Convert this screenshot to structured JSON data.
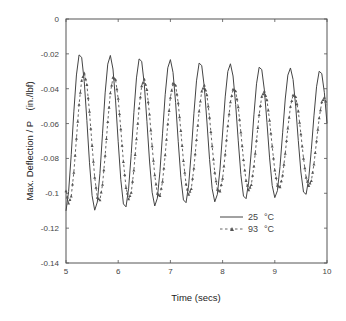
{
  "chart_data": {
    "type": "line",
    "title": "",
    "xlabel": "Time (secs)",
    "ylabel": "Max. Deflection / P    (in./lbf)",
    "xlim": [
      5,
      10
    ],
    "ylim": [
      -0.14,
      0
    ],
    "xticks": [
      5,
      6,
      7,
      8,
      9,
      10
    ],
    "xtick_labels": [
      "5",
      "6",
      "7",
      "8",
      "9",
      "10"
    ],
    "yticks": [
      0,
      -0.02,
      -0.04,
      -0.06,
      -0.08,
      -0.1,
      -0.12,
      -0.14
    ],
    "ytick_labels": [
      "0",
      "-0.02",
      "-0.04",
      "-0.06",
      "-0.08",
      "-0.1",
      "-0.12",
      "-0.14"
    ],
    "grid": false,
    "legend_position": "lower right (inside)",
    "x_start": 5,
    "x_step": 0.05,
    "series": [
      {
        "name": "25 °C",
        "legend_label": "25",
        "legend_unit": "°C",
        "style": "solid",
        "color": "#444444",
        "values": [
          -0.1101,
          -0.099,
          -0.0779,
          -0.0533,
          -0.0321,
          -0.0206,
          -0.022,
          -0.036,
          -0.0583,
          -0.0825,
          -0.1014,
          -0.1097,
          -0.105,
          -0.0887,
          -0.0655,
          -0.0424,
          -0.0259,
          -0.0209,
          -0.0287,
          -0.047,
          -0.0704,
          -0.0922,
          -0.1061,
          -0.1078,
          -0.0971,
          -0.0772,
          -0.0538,
          -0.0338,
          -0.0229,
          -0.0243,
          -0.0375,
          -0.0587,
          -0.0815,
          -0.0994,
          -0.1073,
          -0.1028,
          -0.0874,
          -0.0655,
          -0.0435,
          -0.028,
          -0.0233,
          -0.0306,
          -0.048,
          -0.0702,
          -0.0908,
          -0.1038,
          -0.1054,
          -0.0953,
          -0.0764,
          -0.0544,
          -0.0355,
          -0.0253,
          -0.0267,
          -0.0392,
          -0.0591,
          -0.0806,
          -0.0974,
          -0.1049,
          -0.1006,
          -0.0861,
          -0.0654,
          -0.0447,
          -0.0301,
          -0.0257,
          -0.0327,
          -0.049,
          -0.0699,
          -0.0893,
          -0.1016,
          -0.1031,
          -0.0935,
          -0.0757,
          -0.055,
          -0.0372,
          -0.0277,
          -0.029,
          -0.0407,
          -0.0595,
          -0.0797,
          -0.0955,
          -0.1025,
          -0.0985,
          -0.0847,
          -0.0653,
          -0.0459,
          -0.0322,
          -0.0281,
          -0.0347,
          -0.05,
          -0.0697,
          -0.0878,
          -0.0993,
          -0.1006,
          -0.0916,
          -0.075,
          -0.0556,
          -0.0389,
          -0.03,
          -0.0313,
          -0.0423,
          -0.0599
        ]
      },
      {
        "name": "93 °C",
        "legend_label": "93",
        "legend_unit": "°C",
        "style": "dashed with triangle markers",
        "color": "#555555",
        "values": [
          -0.0987,
          -0.1058,
          -0.1017,
          -0.0881,
          -0.0686,
          -0.0491,
          -0.0353,
          -0.0311,
          -0.0377,
          -0.0531,
          -0.0727,
          -0.0909,
          -0.1024,
          -0.1039,
          -0.095,
          -0.0784,
          -0.059,
          -0.0425,
          -0.0336,
          -0.0348,
          -0.0457,
          -0.0632,
          -0.082,
          -0.0968,
          -0.1033,
          -0.0996,
          -0.0868,
          -0.0689,
          -0.0511,
          -0.0384,
          -0.0346,
          -0.0406,
          -0.0547,
          -0.0729,
          -0.0896,
          -0.1002,
          -0.1014,
          -0.0932,
          -0.0781,
          -0.0603,
          -0.0451,
          -0.0369,
          -0.0381,
          -0.0482,
          -0.0642,
          -0.0814,
          -0.0948,
          -0.1007,
          -0.0974,
          -0.0857,
          -0.0693,
          -0.053,
          -0.0415,
          -0.0381,
          -0.0436,
          -0.0565,
          -0.0729,
          -0.0881,
          -0.0979,
          -0.0989,
          -0.0915,
          -0.0776,
          -0.0614,
          -0.0477,
          -0.0403,
          -0.0413,
          -0.0505,
          -0.065,
          -0.0808,
          -0.0929,
          -0.0982,
          -0.0951,
          -0.0845,
          -0.0698,
          -0.055,
          -0.0445,
          -0.0415,
          -0.0465,
          -0.0582,
          -0.0731,
          -0.0868,
          -0.0955,
          -0.0964,
          -0.0897,
          -0.0772,
          -0.0627,
          -0.0503,
          -0.0436,
          -0.0446,
          -0.0529,
          -0.066,
          -0.08,
          -0.0909,
          -0.0957,
          -0.0929,
          -0.0834,
          -0.0701,
          -0.0569,
          -0.0477,
          -0.045,
          -0.0494
        ]
      }
    ]
  },
  "labels": {
    "x_title": "Time (secs)",
    "y_title": "Max. Deflection / P    (in./lbf)"
  },
  "legend": [
    {
      "label": "25",
      "unit": "°C"
    },
    {
      "label": "93",
      "unit": "°C"
    }
  ]
}
